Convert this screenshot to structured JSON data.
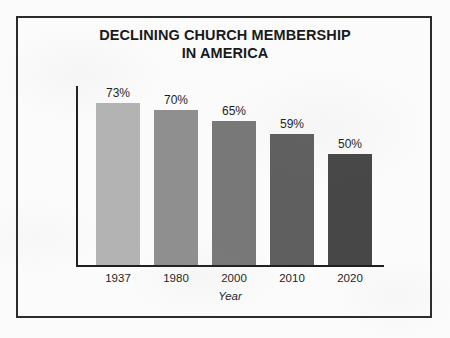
{
  "figure": {
    "background_color": "#fbfbfb",
    "frame_color": "#2b2b2b"
  },
  "chart_data": {
    "type": "bar",
    "title": "DECLINING CHURCH MEMBERSHIP IN AMERICA",
    "title_line1": "DECLINING CHURCH MEMBERSHIP",
    "title_line2": "IN AMERICA",
    "xlabel": "Year",
    "ylabel": "Church Membership (%)",
    "categories": [
      "1937",
      "1980",
      "2000",
      "2010",
      "2020"
    ],
    "values": [
      73,
      70,
      65,
      59,
      50
    ],
    "value_labels": [
      "73%",
      "70%",
      "65%",
      "59%",
      "50%"
    ],
    "bar_colors": [
      "#b3b3b3",
      "#8f8f8f",
      "#787878",
      "#5f5f5f",
      "#474747"
    ],
    "ylim": [
      0,
      80
    ],
    "grid": false,
    "legend": false,
    "axis_color": "#1f1f1f",
    "label_color": "#1e1e1e"
  }
}
